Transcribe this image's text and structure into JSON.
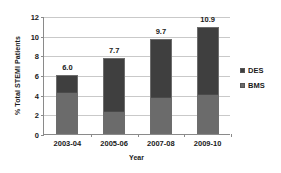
{
  "chart_data": {
    "type": "bar",
    "subtype": "stacked-bar",
    "title": "",
    "xlabel": "Year",
    "ylabel": "% Total STEMI Patients",
    "categories": [
      "2003-04",
      "2005-06",
      "2007-08",
      "2009-10"
    ],
    "series": [
      {
        "name": "DES",
        "values": [
          1.7,
          5.4,
          6.0,
          6.9
        ],
        "color": "#3f3f3f"
      },
      {
        "name": "BMS",
        "values": [
          4.3,
          2.3,
          3.7,
          4.0
        ],
        "color": "#6b6b6b"
      }
    ],
    "stack_order_top_to_bottom": [
      "DES",
      "BMS"
    ],
    "totals": [
      6.0,
      7.7,
      9.7,
      10.9
    ],
    "data_labels": [
      "6.0",
      "7.7",
      "9.7",
      "10.9"
    ],
    "ylim": [
      0,
      12
    ],
    "ytick_values": [
      0,
      2,
      4,
      6,
      8,
      10,
      12
    ],
    "ytick_labels": [
      "0",
      "2",
      "4",
      "6",
      "8",
      "10",
      "12"
    ],
    "grid": true,
    "grid_axis": "y",
    "legend_position": "right",
    "legend_entries": [
      "DES",
      "BMS"
    ]
  },
  "colors": {
    "des": "#3f3f3f",
    "bms": "#6b6b6b",
    "bar_outline": "#6d6d6d",
    "gridline": "#c9c9c9",
    "axis": "#8a8a8a",
    "text": "#1a1a1a",
    "background": "#ffffff"
  }
}
